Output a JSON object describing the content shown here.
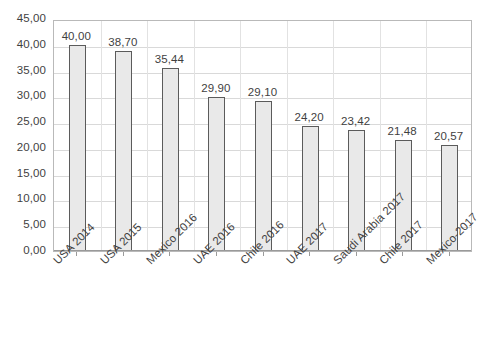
{
  "chart_data": {
    "type": "bar",
    "title": "",
    "subtitle": "",
    "xlabel": "",
    "ylabel": "",
    "ylim": [
      0,
      45
    ],
    "ytick_step": 5,
    "grid": true,
    "legend": "none",
    "decimal_separator": ",",
    "categories": [
      "USA 2014",
      "USA 2015",
      "Mexico 2016",
      "UAE 2016",
      "Chile 2016",
      "UAE 2017",
      "Saudi Arabia 2017",
      "Chile 2017",
      "Mexico-2017"
    ],
    "values": [
      40.0,
      38.7,
      35.44,
      29.9,
      29.1,
      24.2,
      23.42,
      21.48,
      20.57
    ],
    "value_labels": [
      "40,00",
      "38,70",
      "35,44",
      "29,90",
      "29,10",
      "24,20",
      "23,42",
      "21,48",
      "20,57"
    ],
    "ytick_labels": [
      "45,00",
      "40,00",
      "35,00",
      "30,00",
      "25,00",
      "20,00",
      "15,00",
      "10,00",
      "5,00",
      "0,00"
    ],
    "ytick_values": [
      45,
      40,
      35,
      30,
      25,
      20,
      15,
      10,
      5,
      0
    ],
    "colors": {
      "bar_fill": "#e9e9e9",
      "bar_border": "#5b5b5b",
      "gridline": "#d9d9d9",
      "plot_border": "#b9b9b9",
      "text": "#3f3f3f",
      "background": "#ffffff"
    }
  }
}
